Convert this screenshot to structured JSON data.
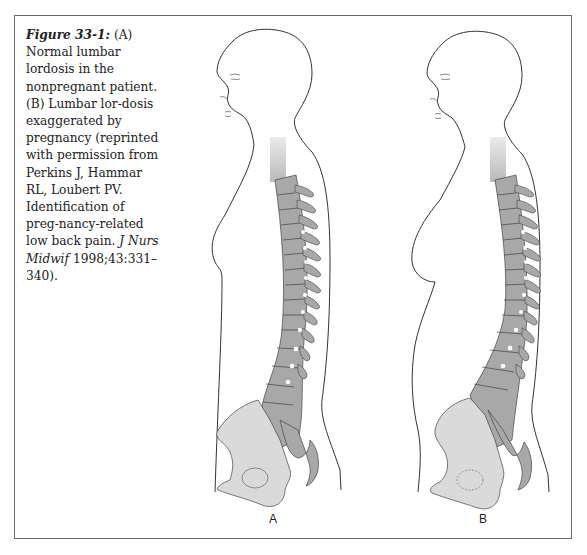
{
  "figure": {
    "label": "Figure 33-1:",
    "caption_parts": {
      "a": " (A) Normal lumbar lordosis in the nonpregnant patient. (B) Lumbar lor-dosis exaggerated by pregnancy (reprinted with permission from Perkins J, Hammar RL, Loubert PV. Identification of preg-nancy-related low back pain. ",
      "journal": "J Nurs Midwif",
      "citation": " 1998;43:331–340)."
    },
    "panels": [
      {
        "id": "A",
        "label": "A",
        "description": "Normal lumbar lordosis in the nonpregnant patient"
      },
      {
        "id": "B",
        "label": "B",
        "description": "Lumbar lordosis exaggerated by pregnancy"
      }
    ]
  },
  "colors": {
    "frame": "#6a6a6a",
    "outline": "#333333",
    "spine_fill": "#a8a8a8",
    "pelvis_fill": "#dadada"
  }
}
